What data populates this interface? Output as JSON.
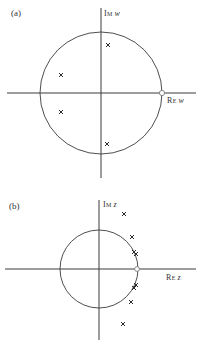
{
  "panels": [
    {
      "id": "a",
      "label": "(a)",
      "imag_axis_label": {
        "prefix": "I",
        "sc": "M",
        "var": "w"
      },
      "real_axis_label": {
        "prefix": "R",
        "sc": "E",
        "var": "w"
      },
      "circle": {
        "cx": 101,
        "cy": 93,
        "r": 61
      },
      "axes": {
        "h_y": 93,
        "h_x1": 7,
        "h_x2": 196,
        "v_x": 101,
        "v_y1": 8,
        "v_y2": 178
      },
      "unit_point": {
        "x": 162,
        "y": 93,
        "marker": "open-circle"
      },
      "poles": [
        {
          "x": 108,
          "y": 45
        },
        {
          "x": 61,
          "y": 75
        },
        {
          "x": 61,
          "y": 112
        },
        {
          "x": 107,
          "y": 144
        }
      ]
    },
    {
      "id": "b",
      "label": "(b)",
      "imag_axis_label": {
        "prefix": "I",
        "sc": "M",
        "var": "z"
      },
      "real_axis_label": {
        "prefix": "R",
        "sc": "E",
        "var": "z"
      },
      "circle": {
        "cx": 99,
        "cy": 269,
        "r": 39
      },
      "axes": {
        "h_y": 269,
        "h_x1": 5,
        "h_x2": 196,
        "v_x": 99,
        "v_y1": 200,
        "v_y2": 340
      },
      "unit_point": {
        "x": 137,
        "y": 269,
        "marker": "open-circle"
      },
      "poles": [
        {
          "x": 124,
          "y": 214
        },
        {
          "x": 132,
          "y": 237
        },
        {
          "x": 134,
          "y": 252
        },
        {
          "x": 136,
          "y": 254
        },
        {
          "x": 136,
          "y": 285
        },
        {
          "x": 134,
          "y": 288
        },
        {
          "x": 131,
          "y": 302
        },
        {
          "x": 123,
          "y": 324
        }
      ]
    }
  ],
  "colors": {
    "line": "#3a3a3a",
    "pole": "#2a2a2a",
    "unit_point": "#888888",
    "text": "#333333"
  }
}
